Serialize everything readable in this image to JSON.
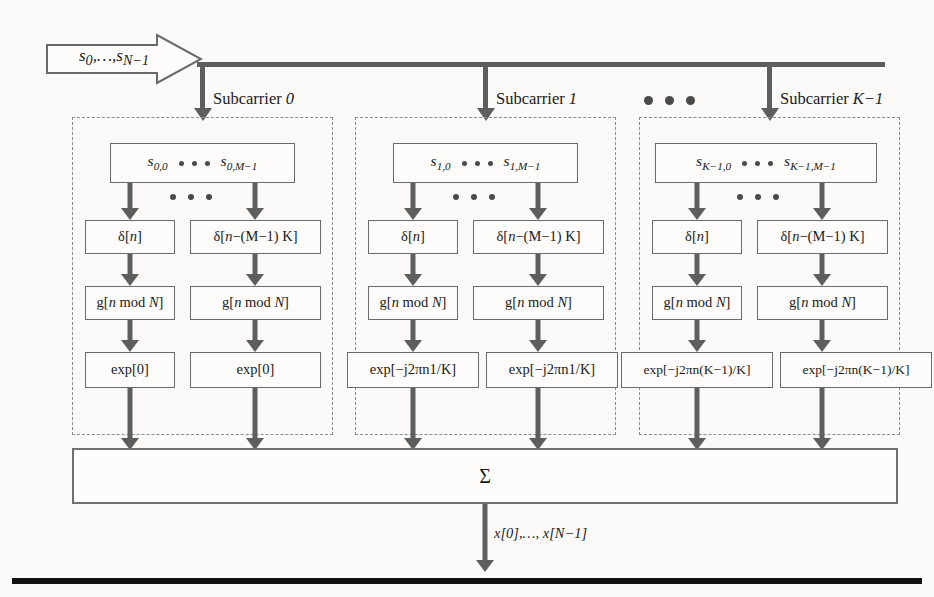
{
  "input": {
    "label": "s0,…,sN−1",
    "label_parts": {
      "base1": "s",
      "sub1": "0",
      "mid": ",…,",
      "base2": "s",
      "sub2": "N−1"
    }
  },
  "columns": [
    {
      "caption": "Subcarrier 0",
      "caption_text": "Subcarrier ",
      "caption_index": "0",
      "data_box": {
        "left": "s0,0",
        "left_base": "s",
        "left_sub": "0,0",
        "right": "s0,M−1",
        "right_base": "s",
        "right_sub": "0,M−1"
      },
      "branches": [
        {
          "delta": "δ[n]",
          "delta_pre": "δ[",
          "delta_var": "n",
          "delta_post": "]",
          "g": "g[n mod N]",
          "exp": "exp[0]"
        },
        {
          "delta": "δ[n−(M−1) K]",
          "delta_pre": "δ[",
          "delta_var": "n",
          "delta_post": "−(M−1) K]",
          "g": "g[n mod N]",
          "exp": "exp[0]"
        }
      ]
    },
    {
      "caption": "Subcarrier 1",
      "caption_text": "Subcarrier ",
      "caption_index": "1",
      "data_box": {
        "left": "s1,0",
        "left_base": "s",
        "left_sub": "1,0",
        "right": "s1,M−1",
        "right_base": "s",
        "right_sub": "1,M−1"
      },
      "branches": [
        {
          "delta": "δ[n]",
          "delta_pre": "δ[",
          "delta_var": "n",
          "delta_post": "]",
          "g": "g[n mod N]",
          "exp": "exp[−j2πn1/K]"
        },
        {
          "delta": "δ[n−(M−1) K]",
          "delta_pre": "δ[",
          "delta_var": "n",
          "delta_post": "−(M−1) K]",
          "g": "g[n mod N]",
          "exp": "exp[−j2πn1/K]"
        }
      ]
    },
    {
      "caption": "Subcarrier K−1",
      "caption_text": "Subcarrier ",
      "caption_index": "K−1",
      "data_box": {
        "left": "sK−1,0",
        "left_base": "s",
        "left_sub": "K−1,0",
        "right": "sK−1,M−1",
        "right_base": "s",
        "right_sub": "K−1,M−1"
      },
      "branches": [
        {
          "delta": "δ[n]",
          "delta_pre": "δ[",
          "delta_var": "n",
          "delta_post": "]",
          "g": "g[n mod N]",
          "exp": "exp[−j2πn(K−1)/K]"
        },
        {
          "delta": "δ[n−(M−1) K]",
          "delta_pre": "δ[",
          "delta_var": "n",
          "delta_post": "−(M−1) K]",
          "g": "g[n mod N]",
          "exp": "exp[−j2πn(K−1)/K]"
        }
      ]
    }
  ],
  "g_box": {
    "pre": "g[",
    "var": "n",
    "mid": " mod ",
    "var2": "N",
    "post": "]"
  },
  "sum_block": {
    "symbol": "Σ"
  },
  "output": {
    "label": "x[0],…, x[N−1]",
    "base1": "x",
    "part1": "[0],…, ",
    "base2": "x",
    "part2": "[N−1]"
  },
  "colors": {
    "arrow": "#5e5e5e",
    "box_border": "#6a6a6a",
    "panel_border": "#8d8d8d",
    "rule": "#111111",
    "background": "#fbfaf8"
  }
}
